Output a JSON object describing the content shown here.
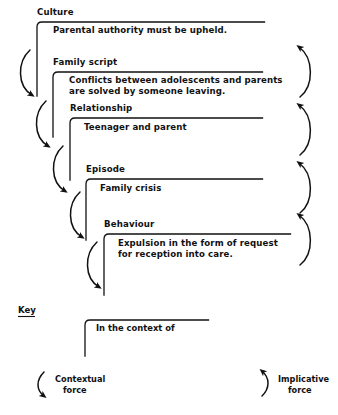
{
  "diagram": {
    "levels": [
      {
        "id": "culture",
        "label": "Culture",
        "lines": [
          "Parental authority must be upheld."
        ]
      },
      {
        "id": "family-script",
        "label": "Family script",
        "lines": [
          "Conflicts between adolescents and parents",
          "are solved by someone leaving."
        ]
      },
      {
        "id": "relationship",
        "label": "Relationship",
        "lines": [
          "Teenager and parent"
        ]
      },
      {
        "id": "episode",
        "label": "Episode",
        "lines": [
          "Family crisis"
        ]
      },
      {
        "id": "behaviour",
        "label": "Behaviour",
        "lines": [
          "Expulsion in the form of request",
          "for reception into care."
        ]
      }
    ]
  },
  "key": {
    "title": "Key",
    "bracket_label": "In the context of",
    "contextual_force": [
      "Contextual",
      "force"
    ],
    "implicative_force": [
      "Implicative",
      "force"
    ]
  },
  "colors": {
    "ink": "#111111",
    "background": "#ffffff"
  }
}
